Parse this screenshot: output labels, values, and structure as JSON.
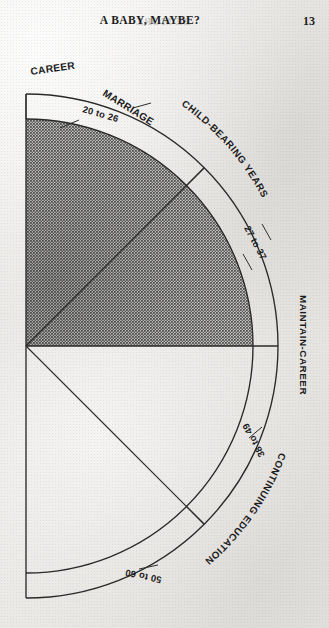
{
  "page": {
    "running_head": "A BABY, MAYBE?",
    "page_number": "13",
    "bleed_through": "BE MORE"
  },
  "diagram": {
    "name": "life-stages-fan-diagram",
    "sectors": [
      {
        "id": "career",
        "label": "CAREER",
        "age_range": "20 to 26",
        "shaded": true
      },
      {
        "id": "marriage",
        "label": "MARRIAGE",
        "age_range": "20 to 26",
        "shaded": true
      },
      {
        "id": "childbear",
        "label": "CHILD-BEARING YEARS",
        "age_range": "27 to 37",
        "shaded": true
      },
      {
        "id": "maintain",
        "label": "MAINTAIN-CAREER",
        "age_range": "38 to 49",
        "shaded": false
      },
      {
        "id": "continued",
        "label": "CONTINUING EDUCATION",
        "age_range": "50 to 60",
        "shaded": false
      }
    ],
    "age_bands": [
      "20 to 26",
      "27 to 37",
      "38 to 49",
      "50 to 60"
    ],
    "band_labels": [
      "CAREER",
      "MARRIAGE",
      "CHILD-BEARING YEARS",
      "MAINTAIN-CAREER",
      "CONTINUING EDUCATION"
    ],
    "colors": {
      "ink": "#2a2a2a",
      "paper": "#e9e8e6",
      "shading": "#6f6f6f"
    },
    "geometry": {
      "origin_x": 26,
      "origin_y": 346,
      "inner_radius": 227,
      "outer_radius": 252
    }
  }
}
